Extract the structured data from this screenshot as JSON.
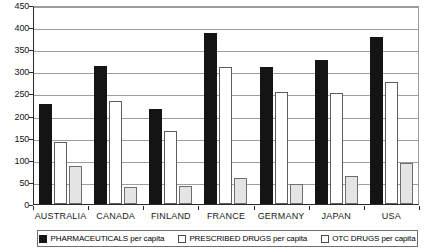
{
  "chart_data": {
    "type": "bar",
    "title": "",
    "subtitle": "",
    "xlabel": "",
    "ylabel": "",
    "ylim": [
      0,
      450
    ],
    "ytick_step": 50,
    "yticks": [
      450,
      400,
      350,
      300,
      250,
      200,
      150,
      100,
      50,
      0
    ],
    "ytick_labels": [
      "450",
      "400",
      "350",
      "300",
      "250",
      "200",
      "150",
      "100",
      "50",
      "0"
    ],
    "grid": true,
    "grid_axis": "y",
    "legend_position": "bottom",
    "categories": [
      "AUSTRALIA",
      "CANADA",
      "FINLAND",
      "FRANCE",
      "GERMANY",
      "JAPAN",
      "USA"
    ],
    "series": [
      {
        "name": "PHARMACEUTICALS per capita",
        "color": "#141414",
        "values": [
          227,
          312,
          215,
          387,
          310,
          326,
          378
        ]
      },
      {
        "name": "PRESCRIBED DRUGS per capita",
        "color": "#ffffff",
        "values": [
          140,
          233,
          165,
          310,
          254,
          251,
          277
        ]
      },
      {
        "name": "OTC DRUGS per capita",
        "color": "#e4e4e4",
        "values": [
          86,
          38,
          41,
          58,
          45,
          63,
          92
        ]
      }
    ]
  },
  "legend": {
    "entries": [
      {
        "label": "PHARMACEUTICALS per capita",
        "swatch": "black-filled-swatch"
      },
      {
        "label": "PRESCRIBED DRUGS per capita",
        "swatch": "white-outlined-swatch"
      },
      {
        "label": "OTC DRUGS per capita",
        "swatch": "gray-outlined-swatch"
      }
    ]
  }
}
